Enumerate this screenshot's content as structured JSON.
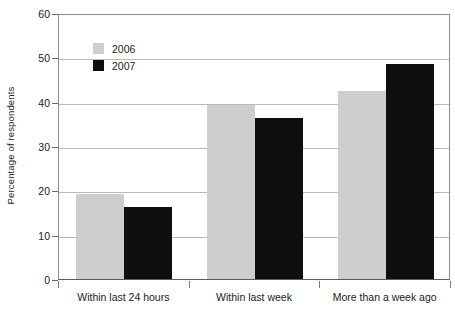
{
  "chart_data": {
    "type": "bar",
    "title": "",
    "subtitle": "",
    "xlabel": "",
    "ylabel": "Percentage of respondents",
    "ylim": [
      0,
      60
    ],
    "yticks": [
      0,
      10,
      20,
      30,
      40,
      50,
      60
    ],
    "ytick_labels": [
      "0",
      "10",
      "20",
      "30",
      "40",
      "50",
      "60"
    ],
    "grid": true,
    "grid_axis": "y",
    "legend_position": "upper-left-inside",
    "categories": [
      "Within last 24 hours",
      "Within last week",
      "More than a week ago"
    ],
    "series": [
      {
        "name": "2006",
        "color": "#cecece",
        "values": [
          19.1,
          39.3,
          42.3
        ]
      },
      {
        "name": "2007",
        "color": "#100f0f",
        "values": [
          16.2,
          36.3,
          48.5
        ]
      }
    ]
  },
  "legend": {
    "items": [
      {
        "label": "2006",
        "color": "#cecece"
      },
      {
        "label": "2007",
        "color": "#100f0f"
      }
    ]
  },
  "axes": {
    "y_title": "Percentage of respondents"
  },
  "colors": {
    "series_2006": "#cecece",
    "series_2007": "#100f0f",
    "gridline": "#b9b9b9",
    "axis": "#5c5c5c",
    "background": "#ffffff"
  }
}
